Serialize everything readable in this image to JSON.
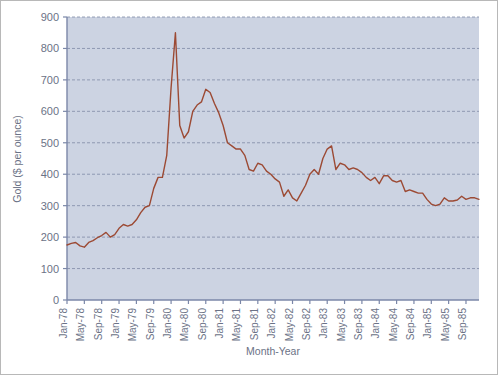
{
  "chart_data": {
    "type": "line",
    "title": "",
    "xlabel": "Month-Year",
    "ylabel": "Gold ($ per ounce)",
    "ylim": [
      0,
      900
    ],
    "yticks": [
      0,
      100,
      200,
      300,
      400,
      500,
      600,
      700,
      800,
      900
    ],
    "grid": true,
    "legend": false,
    "line_color": "#9c4a34",
    "plot_background": "#ccd3e2",
    "axis_color": "#7b87a8",
    "gridline_color": "#7f8aa6",
    "xtick_labels": [
      "Jan-78",
      "May-78",
      "Sep-78",
      "Jan-79",
      "May-79",
      "Sep-79",
      "Jan-80",
      "May-80",
      "Sep-80",
      "Jan-81",
      "May-81",
      "Sep-81",
      "Jan-82",
      "May-82",
      "Sep-82",
      "Jan-83",
      "May-83",
      "Sep-83",
      "Jan-84",
      "May-84",
      "Sep-84",
      "Jan-85",
      "May-85",
      "Sep-85"
    ],
    "xtick_interval_months": 4,
    "x_start": "Jan-78",
    "x_end": "Dec-85",
    "x": [
      "Jan-78",
      "Feb-78",
      "Mar-78",
      "Apr-78",
      "May-78",
      "Jun-78",
      "Jul-78",
      "Aug-78",
      "Sep-78",
      "Oct-78",
      "Nov-78",
      "Dec-78",
      "Jan-79",
      "Feb-79",
      "Mar-79",
      "Apr-79",
      "May-79",
      "Jun-79",
      "Jul-79",
      "Aug-79",
      "Sep-79",
      "Oct-79",
      "Nov-79",
      "Dec-79",
      "Jan-80",
      "Feb-80",
      "Mar-80",
      "Apr-80",
      "May-80",
      "Jun-80",
      "Jul-80",
      "Aug-80",
      "Sep-80",
      "Oct-80",
      "Nov-80",
      "Dec-80",
      "Jan-81",
      "Feb-81",
      "Mar-81",
      "Apr-81",
      "May-81",
      "Jun-81",
      "Jul-81",
      "Aug-81",
      "Sep-81",
      "Oct-81",
      "Nov-81",
      "Dec-81",
      "Jan-82",
      "Feb-82",
      "Mar-82",
      "Apr-82",
      "May-82",
      "Jun-82",
      "Jul-82",
      "Aug-82",
      "Sep-82",
      "Oct-82",
      "Nov-82",
      "Dec-82",
      "Jan-83",
      "Feb-83",
      "Mar-83",
      "Apr-83",
      "May-83",
      "Jun-83",
      "Jul-83",
      "Aug-83",
      "Sep-83",
      "Oct-83",
      "Nov-83",
      "Dec-83",
      "Jan-84",
      "Feb-84",
      "Mar-84",
      "Apr-84",
      "May-84",
      "Jun-84",
      "Jul-84",
      "Aug-84",
      "Sep-84",
      "Oct-84",
      "Nov-84",
      "Dec-84",
      "Jan-85",
      "Feb-85",
      "Mar-85",
      "Apr-85",
      "May-85",
      "Jun-85",
      "Jul-85",
      "Aug-85",
      "Sep-85",
      "Oct-85",
      "Nov-85",
      "Dec-85"
    ],
    "values": [
      175,
      180,
      183,
      172,
      168,
      183,
      189,
      198,
      205,
      215,
      200,
      208,
      228,
      240,
      235,
      240,
      255,
      278,
      295,
      300,
      355,
      390,
      390,
      460,
      675,
      850,
      555,
      515,
      535,
      600,
      620,
      630,
      670,
      660,
      625,
      595,
      555,
      500,
      490,
      480,
      480,
      460,
      415,
      410,
      435,
      430,
      410,
      400,
      385,
      375,
      330,
      350,
      325,
      315,
      340,
      365,
      400,
      415,
      400,
      450,
      480,
      490,
      415,
      435,
      430,
      415,
      420,
      415,
      405,
      390,
      380,
      390,
      370,
      395,
      395,
      380,
      375,
      380,
      345,
      350,
      345,
      340,
      340,
      320,
      305,
      300,
      305,
      325,
      315,
      315,
      318,
      330,
      320,
      325,
      325,
      320
    ]
  }
}
